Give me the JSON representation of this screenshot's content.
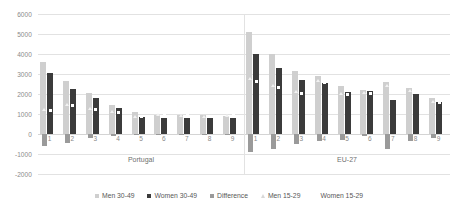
{
  "chart_data": {
    "type": "bar",
    "title": "",
    "xlabel": "",
    "ylabel": "",
    "ylim": [
      -2000,
      6000
    ],
    "ytick_values": [
      6000,
      5000,
      4000,
      3000,
      2000,
      1000,
      0,
      -1000,
      -2000
    ],
    "ytick_labels": [
      "6000",
      "5000",
      "4000",
      "3000",
      "2000",
      "1000",
      "0",
      "-1000",
      "-2000"
    ],
    "grid": true,
    "legend_position": "bottom",
    "panels": [
      {
        "name": "Portugal",
        "categories": [
          "1",
          "2",
          "3",
          "4",
          "5",
          "6",
          "7",
          "8",
          "9"
        ],
        "series": [
          {
            "name": "Men 30-49",
            "values": [
              3600,
              2650,
              2050,
              1450,
              1100,
              950,
              950,
              950,
              900
            ]
          },
          {
            "name": "Women 30-49",
            "values": [
              3050,
              2250,
              1800,
              1300,
              850,
              800,
              800,
              800,
              800
            ]
          },
          {
            "name": "Difference",
            "values": [
              -600,
              -450,
              -200,
              -80,
              -60,
              -50,
              -60,
              -60,
              -60
            ]
          },
          {
            "name": "Men 15-29",
            "values": [
              1150,
              1400,
              1200,
              1050,
              800,
              900,
              850,
              800,
              850
            ]
          },
          {
            "name": "Women 15-29",
            "values": [
              1100,
              1350,
              1150,
              1000,
              780,
              870,
              830,
              780,
              830
            ]
          }
        ]
      },
      {
        "name": "EU-27",
        "categories": [
          "1",
          "2",
          "3",
          "4",
          "5",
          "6",
          "7",
          "8",
          "9"
        ],
        "series": [
          {
            "name": "Men 30-49",
            "values": [
              5100,
              4000,
              3150,
              2900,
              2400,
              2200,
              2600,
              2300,
              1800
            ]
          },
          {
            "name": "Women 30-49",
            "values": [
              4000,
              3300,
              2700,
              2550,
              2100,
              2150,
              1700,
              2000,
              1600
            ]
          },
          {
            "name": "Difference",
            "values": [
              -900,
              -750,
              -500,
              -350,
              -300,
              -100,
              -750,
              -350,
              -200
            ]
          },
          {
            "name": "Men 15-29",
            "values": [
              2700,
              2350,
              2050,
              2600,
              1950,
              2000,
              2350,
              2100,
              1550
            ]
          },
          {
            "name": "Women 15-29",
            "values": [
              2550,
              2250,
              1950,
              2500,
              1900,
              1950,
              2250,
              2000,
              1500
            ]
          }
        ]
      }
    ],
    "colors": {
      "men_30_49": "#cfcfcf",
      "women_30_49": "#3b3b3b",
      "difference": "#9a9a9a",
      "men_15_29": "#f2f2f2",
      "women_15_29": "#ffffff",
      "gridline": "#e2e2e2",
      "axis_text": "#8a8a8a"
    }
  },
  "legend": {
    "items": [
      {
        "label": "Men 30-49",
        "marker": "square",
        "color": "#cfcfcf"
      },
      {
        "label": "Women 30-49",
        "marker": "square",
        "color": "#3b3b3b"
      },
      {
        "label": "Difference",
        "marker": "square",
        "color": "#9a9a9a"
      },
      {
        "label": "Men 15-29",
        "marker": "triangle",
        "color": "#d8d8d8"
      },
      {
        "label": "Women 15-29",
        "marker": "none",
        "color": "#ffffff"
      }
    ]
  },
  "caption": {
    "text": ""
  }
}
